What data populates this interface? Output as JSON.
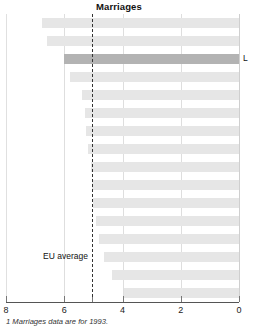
{
  "chart_data": {
    "type": "bar",
    "orientation": "horizontal",
    "title": "Marriages",
    "xlabel": "",
    "ylabel": "",
    "xlim": [
      8,
      0
    ],
    "x_reversed": true,
    "grid": true,
    "gridlines": [
      8,
      6,
      4,
      2,
      0
    ],
    "tick_labels": [
      "8",
      "6",
      "4",
      "2",
      "0"
    ],
    "categories": [
      "1",
      "2",
      "3",
      "4",
      "5",
      "6",
      "7",
      "8",
      "9",
      "10",
      "11",
      "12",
      "13",
      "14",
      "15",
      "16"
    ],
    "values": [
      6.75,
      6.6,
      6.0,
      5.8,
      5.4,
      5.3,
      5.25,
      5.2,
      5.1,
      5.05,
      5.0,
      4.9,
      4.8,
      4.65,
      4.35,
      3.95
    ],
    "highlight_index": 2,
    "highlight_value": 6.0,
    "highlight_label": "L",
    "reference_line": {
      "label": "EU average",
      "value": 5.05
    },
    "footnote": "1 Marriages data are for 1993.",
    "colors": {
      "bar": "#e6e6e6",
      "bar_highlight": "#b3b3b3",
      "axis": "#555555",
      "grid": "#dedede",
      "reference_line": "#333333"
    }
  }
}
